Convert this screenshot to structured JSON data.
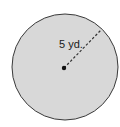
{
  "diagram": {
    "shape": "circle",
    "radius_label": "5 yd.",
    "fill_color": "#d8d8d8",
    "stroke_color": "#3a3a3a",
    "center_dot_color": "#111111",
    "radius_line_style": "dashed"
  }
}
